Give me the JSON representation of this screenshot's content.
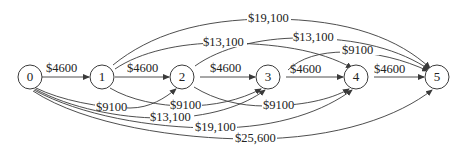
{
  "diagram": {
    "type": "directed-network",
    "nodes": [
      {
        "id": "0",
        "label": "0",
        "x": 30,
        "y": 77
      },
      {
        "id": "1",
        "label": "1",
        "x": 102,
        "y": 77
      },
      {
        "id": "2",
        "label": "2",
        "x": 182,
        "y": 77
      },
      {
        "id": "3",
        "label": "3",
        "x": 268,
        "y": 77
      },
      {
        "id": "4",
        "label": "4",
        "x": 356,
        "y": 77
      },
      {
        "id": "5",
        "label": "5",
        "x": 437,
        "y": 77
      }
    ],
    "edges": [
      {
        "from": "0",
        "to": "1",
        "label": "$4600"
      },
      {
        "from": "1",
        "to": "2",
        "label": "$4600"
      },
      {
        "from": "2",
        "to": "3",
        "label": "$4600"
      },
      {
        "from": "3",
        "to": "4",
        "label": "$4600"
      },
      {
        "from": "4",
        "to": "5",
        "label": "$4600"
      },
      {
        "from": "0",
        "to": "2",
        "label": "$9100"
      },
      {
        "from": "1",
        "to": "3",
        "label": "$9100"
      },
      {
        "from": "2",
        "to": "4",
        "label": "$9100"
      },
      {
        "from": "3",
        "to": "5",
        "label": "$9100"
      },
      {
        "from": "0",
        "to": "3",
        "label": "$13,100"
      },
      {
        "from": "1",
        "to": "4",
        "label": "$13,100"
      },
      {
        "from": "2",
        "to": "5",
        "label": "$13,100"
      },
      {
        "from": "0",
        "to": "4",
        "label": "$19,100"
      },
      {
        "from": "1",
        "to": "5",
        "label": "$19,100"
      },
      {
        "from": "0",
        "to": "5",
        "label": "$25,600"
      }
    ]
  },
  "colors": {
    "stroke": "#3a3a3a",
    "text": "#222222",
    "background": "#ffffff"
  }
}
